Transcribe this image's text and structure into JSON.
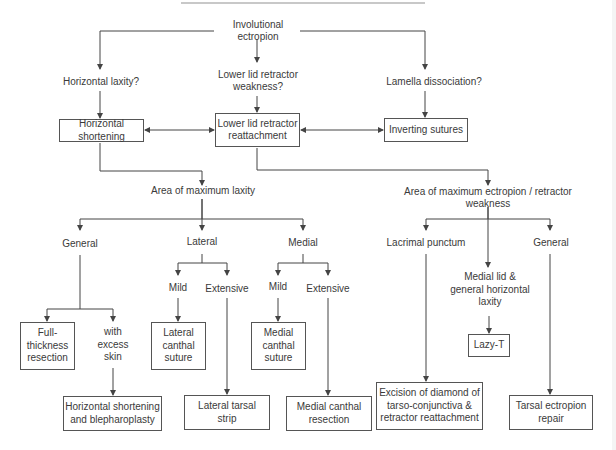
{
  "diagram": {
    "title": "Involutional ectropion",
    "nodes": [
      {
        "id": "root",
        "label": "Involutional ectropion",
        "x": 215,
        "y": 24,
        "w": 86,
        "h": 14,
        "box": false
      },
      {
        "id": "q_horiz",
        "label": "Horizontal laxity?",
        "x": 62,
        "y": 75,
        "w": 78,
        "h": 14,
        "box": false
      },
      {
        "id": "q_retr",
        "label": "Lower lid retractor\nweakness?",
        "x": 215,
        "y": 67,
        "w": 86,
        "h": 28,
        "box": false
      },
      {
        "id": "q_lam",
        "label": "Lamella dissociation?",
        "x": 386,
        "y": 75,
        "w": 96,
        "h": 14,
        "box": false
      },
      {
        "id": "horiz_short",
        "label": "Horizontal shortening",
        "x": 59,
        "y": 119,
        "w": 85,
        "h": 23,
        "box": true
      },
      {
        "id": "retr_reatt",
        "label": "Lower lid retractor\nreattachment",
        "x": 215,
        "y": 113,
        "w": 85,
        "h": 34,
        "box": true
      },
      {
        "id": "inv_sut",
        "label": "Inverting sutures",
        "x": 384,
        "y": 118,
        "w": 84,
        "h": 24,
        "box": true
      },
      {
        "id": "area_lax",
        "label": "Area of maximum laxity",
        "x": 130,
        "y": 41,
        "w": 106,
        "h": 14,
        "box": false,
        "yAbs": 191
      },
      {
        "id": "area_ect",
        "label": "Area of maximum ectropion / retractor weakness",
        "x": 388,
        "y": 191,
        "w": 200,
        "h": 14,
        "box": false
      },
      {
        "id": "gen_l",
        "label": "General",
        "x": 57,
        "y": 237,
        "w": 46,
        "h": 14,
        "box": false
      },
      {
        "id": "lateral",
        "label": "Lateral",
        "x": 180,
        "y": 235,
        "w": 44,
        "h": 14,
        "box": false
      },
      {
        "id": "medial",
        "label": "Medial",
        "x": 281,
        "y": 236,
        "w": 44,
        "h": 14,
        "box": false
      },
      {
        "id": "lacrimal",
        "label": "Lacrimal punctum",
        "x": 384,
        "y": 236,
        "w": 84,
        "h": 14,
        "box": false
      },
      {
        "id": "gen_r",
        "label": "General",
        "x": 528,
        "y": 236,
        "w": 46,
        "h": 14,
        "box": false
      },
      {
        "id": "lat_mild",
        "label": "Mild",
        "x": 166,
        "y": 281,
        "w": 24,
        "h": 14,
        "box": false
      },
      {
        "id": "lat_ext",
        "label": "Extensive",
        "x": 205,
        "y": 282,
        "w": 44,
        "h": 14,
        "box": false
      },
      {
        "id": "med_mild",
        "label": "Mild",
        "x": 266,
        "y": 280,
        "w": 24,
        "h": 14,
        "box": false
      },
      {
        "id": "med_ext",
        "label": "Extensive",
        "x": 306,
        "y": 282,
        "w": 44,
        "h": 14,
        "box": false
      },
      {
        "id": "medial_lid",
        "label": "Medial lid &\ngeneral horizontal\nlaxity",
        "x": 445,
        "y": 270,
        "w": 90,
        "h": 40,
        "box": false
      },
      {
        "id": "full_thick",
        "label": "Full-\nthickness\nresection",
        "x": 20,
        "y": 322,
        "w": 55,
        "h": 48,
        "box": true
      },
      {
        "id": "excess_skin",
        "label": "with\nexcess\nskin",
        "x": 95,
        "y": 325,
        "w": 36,
        "h": 40,
        "box": false
      },
      {
        "id": "lat_canthal",
        "label": "Lateral\ncanthal\nsuture",
        "x": 151,
        "y": 322,
        "w": 55,
        "h": 48,
        "box": true
      },
      {
        "id": "med_canthal",
        "label": "Medial\ncanthal\nsuture",
        "x": 251,
        "y": 322,
        "w": 55,
        "h": 48,
        "box": true
      },
      {
        "id": "lazy_t",
        "label": "Lazy-T",
        "x": 468,
        "y": 334,
        "w": 42,
        "h": 23,
        "box": true
      },
      {
        "id": "horiz_bleph",
        "label": "Horizontal shortening\nand blepharoplasty",
        "x": 63,
        "y": 396,
        "w": 99,
        "h": 35,
        "box": true
      },
      {
        "id": "lat_tarsal",
        "label": "Lateral tarsal\nstrip",
        "x": 184,
        "y": 395,
        "w": 86,
        "h": 35,
        "box": true
      },
      {
        "id": "med_resect",
        "label": "Medial canthal\nresection",
        "x": 286,
        "y": 396,
        "w": 86,
        "h": 35,
        "box": true
      },
      {
        "id": "diamond",
        "label": "Excision of diamond of\ntarso-conjunctiva &\nretractor reattachment",
        "x": 376,
        "y": 382,
        "w": 107,
        "h": 48,
        "box": true
      },
      {
        "id": "tarsal_ect",
        "label": "Tarsal ectropion\nrepair",
        "x": 509,
        "y": 395,
        "w": 84,
        "h": 35,
        "box": true
      }
    ],
    "edges": [
      {
        "from": "root",
        "to": "q_horiz",
        "points": [
          [
            214,
            31
          ],
          [
            100,
            31
          ],
          [
            100,
            69
          ]
        ],
        "arrow": "end"
      },
      {
        "from": "root",
        "to": "q_retr",
        "points": [
          [
            257,
            39
          ],
          [
            257,
            62
          ]
        ],
        "arrow": "end"
      },
      {
        "from": "root",
        "to": "q_lam",
        "points": [
          [
            300,
            31
          ],
          [
            425,
            31
          ],
          [
            425,
            69
          ]
        ],
        "arrow": "end"
      },
      {
        "from": "q_horiz",
        "to": "horiz_short",
        "points": [
          [
            100,
            91
          ],
          [
            100,
            118
          ]
        ],
        "arrow": "end"
      },
      {
        "from": "q_retr",
        "to": "retr_reatt",
        "points": [
          [
            257,
            96
          ],
          [
            257,
            112
          ]
        ],
        "arrow": "end"
      },
      {
        "from": "q_lam",
        "to": "inv_sut",
        "points": [
          [
            425,
            91
          ],
          [
            425,
            117
          ]
        ],
        "arrow": "end"
      },
      {
        "from": "horiz_short",
        "to": "retr_reatt",
        "points": [
          [
            145,
            130
          ],
          [
            214,
            130
          ]
        ],
        "arrow": "both"
      },
      {
        "from": "retr_reatt",
        "to": "inv_sut",
        "points": [
          [
            301,
            130
          ],
          [
            383,
            130
          ]
        ],
        "arrow": "both"
      },
      {
        "from": "horiz_short",
        "to": "area_lax",
        "points": [
          [
            100,
            143
          ],
          [
            100,
            171
          ],
          [
            202,
            171
          ],
          [
            202,
            185
          ]
        ],
        "arrow": "end"
      },
      {
        "from": "retr_reatt",
        "to": "area_ect",
        "points": [
          [
            257,
            148
          ],
          [
            257,
            170
          ],
          [
            488,
            170
          ],
          [
            488,
            185
          ]
        ],
        "arrow": "end"
      },
      {
        "from": "area_lax",
        "to": "gen_l",
        "points": [
          [
            202,
            199
          ],
          [
            202,
            219
          ],
          [
            80,
            219
          ],
          [
            80,
            230
          ]
        ],
        "arrow": "end"
      },
      {
        "from": "area_lax",
        "to": "lateral",
        "points": [
          [
            202,
            199
          ],
          [
            202,
            230
          ]
        ],
        "arrow": "end"
      },
      {
        "from": "area_lax",
        "to": "medial",
        "points": [
          [
            202,
            219
          ],
          [
            303,
            219
          ],
          [
            303,
            230
          ]
        ],
        "arrow": "end"
      },
      {
        "from": "area_ect",
        "to": "lacrimal",
        "points": [
          [
            488,
            207
          ],
          [
            488,
            219
          ],
          [
            426,
            219
          ],
          [
            426,
            230
          ]
        ],
        "arrow": "end"
      },
      {
        "from": "area_ect",
        "to": "gen_r",
        "points": [
          [
            488,
            219
          ],
          [
            550,
            219
          ],
          [
            550,
            230
          ]
        ],
        "arrow": "end"
      },
      {
        "from": "area_ect",
        "to": "medial_lid",
        "points": [
          [
            488,
            207
          ],
          [
            488,
            267
          ]
        ],
        "arrow": "end"
      },
      {
        "from": "lateral",
        "to": "lat_mild",
        "points": [
          [
            202,
            254
          ],
          [
            202,
            263
          ],
          [
            178,
            263
          ],
          [
            178,
            275
          ]
        ],
        "arrow": "end"
      },
      {
        "from": "lateral",
        "to": "lat_ext",
        "points": [
          [
            202,
            263
          ],
          [
            227,
            263
          ],
          [
            227,
            275
          ]
        ],
        "arrow": "end"
      },
      {
        "from": "medial",
        "to": "med_mild",
        "points": [
          [
            303,
            254
          ],
          [
            303,
            263
          ],
          [
            278,
            263
          ],
          [
            278,
            275
          ]
        ],
        "arrow": "end"
      },
      {
        "from": "medial",
        "to": "med_ext",
        "points": [
          [
            303,
            263
          ],
          [
            328,
            263
          ],
          [
            328,
            275
          ]
        ],
        "arrow": "end"
      },
      {
        "from": "gen_l",
        "to": "full_thick",
        "points": [
          [
            80,
            255
          ],
          [
            80,
            309
          ],
          [
            47,
            309
          ],
          [
            47,
            321
          ]
        ],
        "arrow": "end"
      },
      {
        "from": "gen_l",
        "to": "excess_skin",
        "points": [
          [
            80,
            309
          ],
          [
            113,
            309
          ],
          [
            113,
            321
          ]
        ],
        "arrow": "end"
      },
      {
        "from": "lat_mild",
        "to": "lat_canthal",
        "points": [
          [
            178,
            298
          ],
          [
            178,
            321
          ]
        ],
        "arrow": "end"
      },
      {
        "from": "med_mild",
        "to": "med_canthal",
        "points": [
          [
            278,
            298
          ],
          [
            278,
            321
          ]
        ],
        "arrow": "end"
      },
      {
        "from": "excess_skin",
        "to": "horiz_bleph",
        "points": [
          [
            113,
            368
          ],
          [
            113,
            395
          ]
        ],
        "arrow": "end"
      },
      {
        "from": "lat_ext",
        "to": "lat_tarsal",
        "points": [
          [
            227,
            298
          ],
          [
            227,
            394
          ]
        ],
        "arrow": "end"
      },
      {
        "from": "med_ext",
        "to": "med_resect",
        "points": [
          [
            328,
            298
          ],
          [
            328,
            395
          ]
        ],
        "arrow": "end"
      },
      {
        "from": "lacrimal",
        "to": "diamond",
        "points": [
          [
            426,
            254
          ],
          [
            426,
            381
          ]
        ],
        "arrow": "end"
      },
      {
        "from": "medial_lid",
        "to": "lazy_t",
        "points": [
          [
            489,
            316
          ],
          [
            489,
            333
          ]
        ],
        "arrow": "end"
      },
      {
        "from": "gen_r",
        "to": "tarsal_ect",
        "points": [
          [
            550,
            254
          ],
          [
            550,
            394
          ]
        ],
        "arrow": "end"
      }
    ]
  },
  "colors": {
    "line": "#444444",
    "text": "#3a3a3a",
    "box_border": "#555555",
    "top_rule": "#c8c8c8"
  }
}
